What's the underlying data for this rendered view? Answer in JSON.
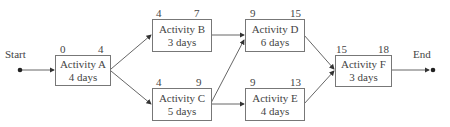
{
  "diagram": {
    "type": "activity-on-node network",
    "start_label": "Start",
    "end_label": "End",
    "nodes": [
      {
        "id": "A",
        "name": "Activity A",
        "duration": "4 days",
        "early_start": "0",
        "early_finish": "4"
      },
      {
        "id": "B",
        "name": "Activity B",
        "duration": "3 days",
        "early_start": "4",
        "early_finish": "7"
      },
      {
        "id": "C",
        "name": "Activity C",
        "duration": "5 days",
        "early_start": "4",
        "early_finish": "9"
      },
      {
        "id": "D",
        "name": "Activity D",
        "duration": "6 days",
        "early_start": "9",
        "early_finish": "15"
      },
      {
        "id": "E",
        "name": "Activity E",
        "duration": "4 days",
        "early_start": "9",
        "early_finish": "13"
      },
      {
        "id": "F",
        "name": "Activity F",
        "duration": "3 days",
        "early_start": "15",
        "early_finish": "18"
      }
    ],
    "edges": [
      [
        "Start",
        "A"
      ],
      [
        "A",
        "B"
      ],
      [
        "A",
        "C"
      ],
      [
        "B",
        "D"
      ],
      [
        "C",
        "D"
      ],
      [
        "C",
        "E"
      ],
      [
        "D",
        "F"
      ],
      [
        "E",
        "F"
      ],
      [
        "F",
        "End"
      ]
    ]
  }
}
